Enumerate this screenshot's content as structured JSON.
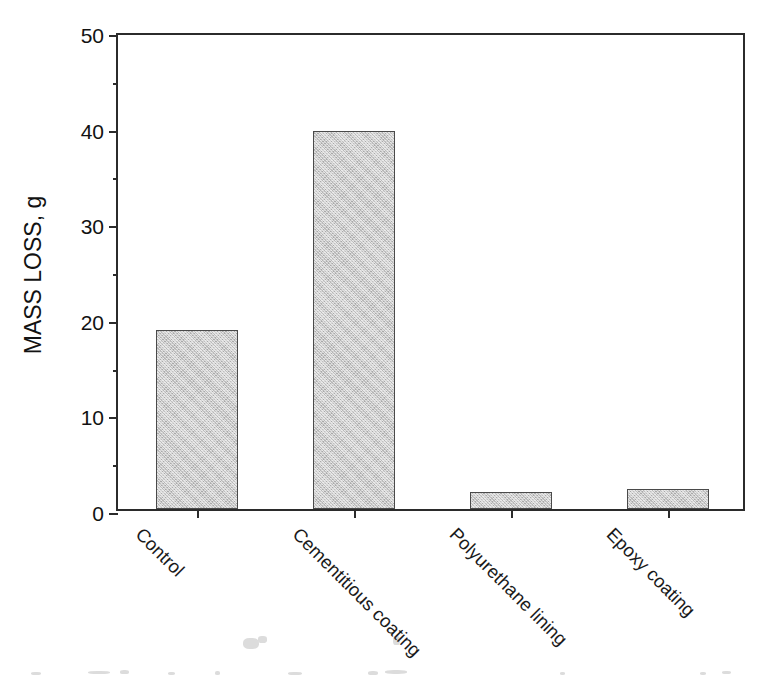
{
  "chart_data": {
    "type": "bar",
    "title": "",
    "subtitle": "",
    "xlabel": "",
    "ylabel": "MASS LOSS, g",
    "categories": [
      "Control",
      "Cementitious coating",
      "Polyurethane lining",
      "Epoxy coating"
    ],
    "values": [
      18.7,
      39.5,
      1.8,
      2.1
    ],
    "ylim": [
      0,
      50
    ],
    "ytick_labels": [
      "0",
      "10",
      "20",
      "30",
      "40",
      "50"
    ],
    "ytick_values": [
      0,
      10,
      20,
      30,
      40,
      50
    ],
    "yminor_values": [
      5,
      15,
      25,
      35,
      45
    ],
    "grid": false,
    "legend": false,
    "legend_position": "none",
    "bar_fill_color": "#c9c9c9",
    "bar_edge_color": "#4a4a4a",
    "axis_color": "#2b2b2b",
    "background_color": "#ffffff",
    "xtick_label_rotation": 45,
    "annotations": []
  }
}
